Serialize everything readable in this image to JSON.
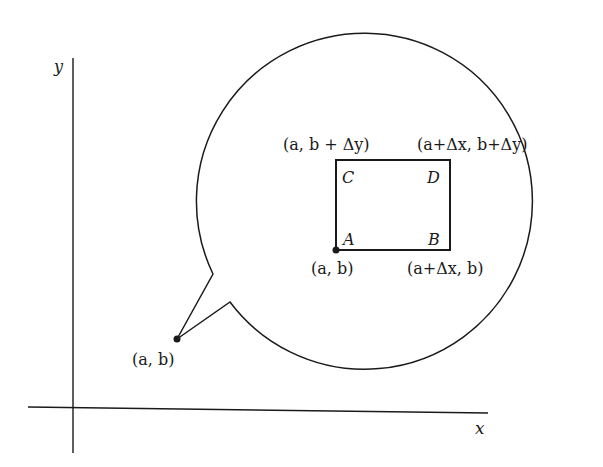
{
  "diagram": {
    "axes": {
      "x_label": "x",
      "y_label": "y"
    },
    "point": {
      "label": "(a, b)"
    },
    "magnified_view": {
      "corners": {
        "A": {
          "name": "A",
          "coord_label": "(a, b)"
        },
        "B": {
          "name": "B",
          "coord_label": "(a+Δx, b)"
        },
        "C": {
          "name": "C",
          "coord_label": "(a, b + Δy)"
        },
        "D": {
          "name": "D",
          "coord_label": "(a+Δx, b+Δy)"
        }
      }
    },
    "colors": {
      "stroke": "#1a1a1a",
      "background": "#ffffff"
    }
  }
}
